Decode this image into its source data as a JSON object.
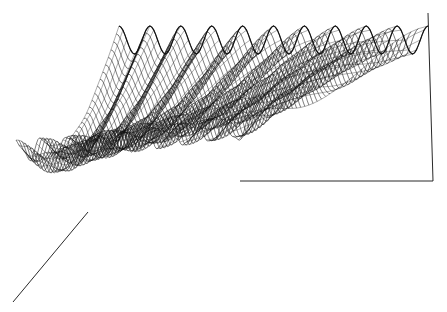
{
  "chart_data": {
    "type": "surface-3d-wireframe",
    "title": "",
    "xlabel": "",
    "ylabel": "",
    "zlabel": "",
    "back_row_peaks": 10,
    "front_row_peaks": 3,
    "line_color": "#111111",
    "background": "#ffffff",
    "axes": {
      "back_left_top": [
        119,
        26
      ],
      "back_right_top": [
        428,
        13
      ],
      "back_right_bottom": [
        433,
        181
      ],
      "floor_left": [
        240,
        181
      ],
      "diag_start": [
        88,
        212
      ],
      "diag_end": [
        13,
        302
      ]
    }
  }
}
